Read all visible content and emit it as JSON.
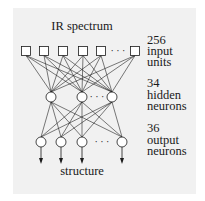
{
  "diagram": {
    "title": "IR spectrum",
    "bottom_label": "structure",
    "layers": [
      {
        "name": "input",
        "count_label": "256",
        "line1": "input",
        "line2": "units",
        "shape": "square",
        "nodes_x": [
          26,
          44,
          63,
          83,
          101,
          135
        ],
        "ellipsis_after_index": 4,
        "y": 51
      },
      {
        "name": "hidden",
        "count_label": "34",
        "line1": "hidden",
        "line2": "neurons",
        "shape": "circle",
        "nodes_x": [
          51,
          82,
          112
        ],
        "ellipsis_after_index": 1,
        "y": 97
      },
      {
        "name": "output",
        "count_label": "36",
        "line1": "output",
        "line2": "neurons",
        "shape": "circle",
        "nodes_x": [
          41,
          61,
          82,
          122
        ],
        "ellipsis_after_index": 2,
        "y": 142
      }
    ],
    "ellipsis": "· · ·",
    "colors": {
      "panel": "#f1f1f1",
      "ink": "#1a1a1a",
      "node_fill": "#ffffff"
    }
  }
}
